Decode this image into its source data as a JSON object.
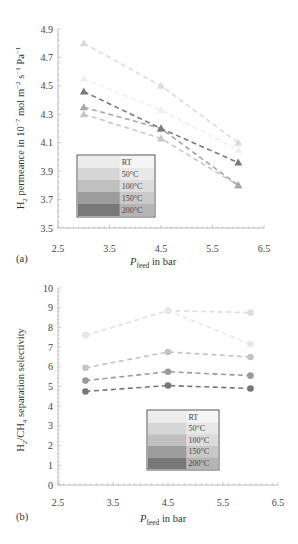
{
  "chart_data": [
    {
      "panel": "(a)",
      "type": "line",
      "title": "",
      "xlabel": "P_feed in bar",
      "xlabel_main": "P",
      "xlabel_sub": "feed",
      "xlabel_rest": " in bar",
      "ylabel": "H2 permeance in 10^-7 mol m^-2 s^-1 Pa^-1",
      "ylabel_parts": [
        "H",
        "2",
        " permeance in  10",
        "−7",
        " mol m",
        "−2",
        " s",
        "−1",
        " Pa",
        "−1"
      ],
      "xlim": [
        2.5,
        6.5
      ],
      "ylim": [
        3.5,
        4.9
      ],
      "xticks": [
        "2.5",
        "3.5",
        "4.5",
        "5.5",
        "6.5"
      ],
      "yticks": [
        "3.5",
        "3.7",
        "3.9",
        "4.1",
        "4.3",
        "4.5",
        "4.7",
        "4.9"
      ],
      "marker": "triangle",
      "x": [
        3,
        4.5,
        6
      ],
      "series": [
        {
          "name": "RT",
          "values": [
            4.8,
            4.5,
            4.1
          ],
          "color": "#dcdcdc"
        },
        {
          "name": "50°C",
          "values": [
            4.55,
            4.33,
            4.05
          ],
          "color": "#efefef"
        },
        {
          "name": "100°C",
          "values": [
            4.3,
            4.13,
            3.8
          ],
          "color": "#c8c8c8"
        },
        {
          "name": "150°C",
          "values": [
            4.35,
            4.2,
            3.8
          ],
          "color": "#a6a6a6"
        },
        {
          "name": "200°C",
          "values": [
            4.46,
            4.2,
            3.96
          ],
          "color": "#7a7a7a"
        }
      ],
      "legend": {
        "position": "lower-left",
        "entries": [
          {
            "label": "RT",
            "swatch": "#ececec"
          },
          {
            "label": "50°C",
            "swatch": "#d6d6d6"
          },
          {
            "label": "100°C",
            "swatch": "#c0c0c0"
          },
          {
            "label": "150°C",
            "swatch": "#9c9c9c"
          },
          {
            "label": "200°C",
            "swatch": "#787878"
          }
        ]
      },
      "grid": false
    },
    {
      "panel": "(b)",
      "type": "line",
      "title": "",
      "xlabel": "P_feed in bar",
      "xlabel_main": "P",
      "xlabel_sub": "feed",
      "xlabel_rest": " in bar",
      "ylabel": "H2/CH4 separation selectivity",
      "ylabel_parts": [
        "H",
        "2",
        "/CH",
        "4",
        " separation selectivity"
      ],
      "xlim": [
        2.5,
        6.5
      ],
      "ylim": [
        0,
        10
      ],
      "xticks": [
        "2.5",
        "3.5",
        "4.5",
        "5.5",
        "6.5"
      ],
      "yticks": [
        "0",
        "1",
        "2",
        "3",
        "4",
        "5",
        "6",
        "7",
        "8",
        "9",
        "10"
      ],
      "marker": "circle",
      "x": [
        3,
        4.5,
        6
      ],
      "series": [
        {
          "name": "RT",
          "values": [
            7.6,
            8.85,
            8.75
          ],
          "color": "#dedede"
        },
        {
          "name": "50°C",
          "values": [
            7.6,
            8.85,
            7.15
          ],
          "color": "#e8e8e8"
        },
        {
          "name": "100°C",
          "values": [
            5.95,
            6.75,
            6.5
          ],
          "color": "#c4c4c4"
        },
        {
          "name": "150°C",
          "values": [
            5.3,
            5.75,
            5.55
          ],
          "color": "#9a9a9a"
        },
        {
          "name": "200°C",
          "values": [
            4.75,
            5.05,
            4.9
          ],
          "color": "#777777"
        }
      ],
      "legend": {
        "position": "lower-right",
        "entries": [
          {
            "label": "RT",
            "swatch": "#ececec"
          },
          {
            "label": "50°C",
            "swatch": "#d6d6d6"
          },
          {
            "label": "100°C",
            "swatch": "#c0c0c0"
          },
          {
            "label": "150°C",
            "swatch": "#9c9c9c"
          },
          {
            "label": "200°C",
            "swatch": "#787878"
          }
        ]
      },
      "grid": false
    }
  ]
}
